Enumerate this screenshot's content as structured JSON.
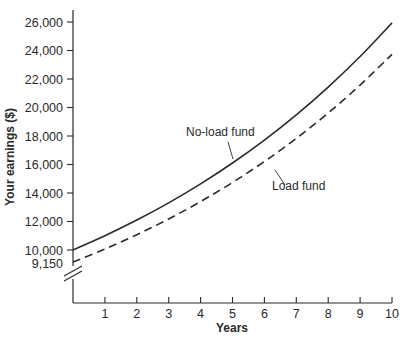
{
  "chart_data": {
    "type": "line",
    "title": "",
    "xlabel": "Years",
    "ylabel": "Your earnings ($)",
    "x": [
      0,
      1,
      2,
      3,
      4,
      5,
      6,
      7,
      8,
      9,
      10
    ],
    "x_ticks": [
      "1",
      "2",
      "3",
      "4",
      "5",
      "6",
      "7",
      "8",
      "9",
      "10"
    ],
    "y_ticks": [
      "9,150",
      "10,000",
      "12,000",
      "14,000",
      "16,000",
      "18,000",
      "20,000",
      "22,000",
      "24,000",
      "26,000"
    ],
    "ylim": [
      9000,
      26000
    ],
    "xlim": [
      0,
      10
    ],
    "y_axis_break": true,
    "grid": false,
    "legend": "inline annotations",
    "series": [
      {
        "name": "No-load fund",
        "style": "solid",
        "values": [
          10000,
          11000,
          12100,
          13310,
          14641,
          16105,
          17716,
          19487,
          21436,
          23579,
          25937
        ]
      },
      {
        "name": "Load fund",
        "style": "dashed",
        "values": [
          9150,
          10065,
          11072,
          12179,
          13397,
          14736,
          16210,
          17831,
          19614,
          21575,
          23733
        ]
      }
    ],
    "annotations": [
      {
        "text": "No-load fund",
        "points_to": "No-load fund",
        "near_x": 5.3
      },
      {
        "text": "Load fund",
        "points_to": "Load fund",
        "near_x": 5.8
      }
    ]
  },
  "colors": {
    "ink": "#2a2a2a",
    "background": "#ffffff"
  }
}
